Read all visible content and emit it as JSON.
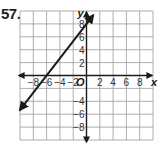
{
  "problem": {
    "number": "57."
  },
  "chart_data": {
    "type": "line",
    "title": "",
    "xlabel": "x",
    "ylabel": "y",
    "origin_label": "O",
    "xlim": [
      -10,
      10
    ],
    "ylim": [
      -10,
      10
    ],
    "grid": true,
    "grid_step": 2,
    "x_ticks": [
      -8,
      -6,
      -4,
      -2,
      2,
      4,
      6,
      8
    ],
    "y_ticks": [
      8,
      6,
      4,
      2,
      -4,
      -6,
      -8
    ],
    "x_tick_labels": [
      "−8",
      "−6",
      "−4",
      "−2",
      "2",
      "4",
      "6",
      "8"
    ],
    "y_tick_labels": [
      "8",
      "6",
      "4",
      "2",
      "−4",
      "−6",
      "−8"
    ],
    "series": [
      {
        "name": "line",
        "points": [
          [
            -10,
            -5.33
          ],
          [
            -6,
            0
          ],
          [
            0,
            8
          ],
          [
            1,
            9.33
          ]
        ],
        "slope": 1.333,
        "y_intercept": 8,
        "x_intercept": -6,
        "arrows": "both",
        "color": "#1a1a1a"
      }
    ]
  },
  "colors": {
    "grid": "#9a9a9a",
    "axis": "#1a1a1a",
    "line": "#1a1a1a"
  }
}
